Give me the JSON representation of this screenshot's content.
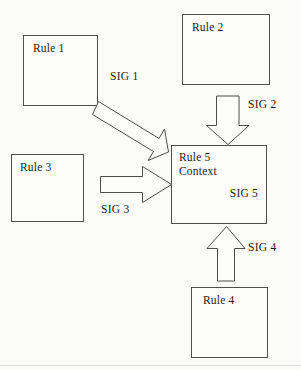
{
  "diagram": {
    "background_color": "#fbfbfa",
    "line_color": "#4d4d4d",
    "text_color": "#1c1c1c",
    "boxes": [
      {
        "id": "rule1",
        "label": "Rule 1",
        "x": 23,
        "y": 35,
        "width": 75,
        "height": 71
      },
      {
        "id": "rule2",
        "label": "Rule 2",
        "x": 182,
        "y": 14,
        "width": 88,
        "height": 71
      },
      {
        "id": "rule3",
        "label": "Rule 3",
        "x": 11,
        "y": 154,
        "width": 73,
        "height": 68
      },
      {
        "id": "rule4",
        "label": "Rule 4",
        "x": 191,
        "y": 287,
        "width": 77,
        "height": 71
      },
      {
        "id": "rule5",
        "label": "Rule 5",
        "label2": "Context",
        "label3": "SIG 5",
        "x": 171,
        "y": 145,
        "width": 96,
        "height": 79
      }
    ],
    "signals": [
      {
        "id": "sig1",
        "label": "SIG 1",
        "from": "rule1",
        "to": "rule5",
        "direction": "diagonal-down-right"
      },
      {
        "id": "sig2",
        "label": "SIG 2",
        "from": "rule2",
        "to": "rule5",
        "direction": "down"
      },
      {
        "id": "sig3",
        "label": "SIG 3",
        "from": "rule3",
        "to": "rule5",
        "direction": "right"
      },
      {
        "id": "sig4",
        "label": "SIG 4",
        "from": "rule4",
        "to": "rule5",
        "direction": "up"
      },
      {
        "id": "sig5",
        "label": "SIG 5",
        "from": "rule5",
        "to": "rule5",
        "direction": "internal"
      }
    ]
  }
}
